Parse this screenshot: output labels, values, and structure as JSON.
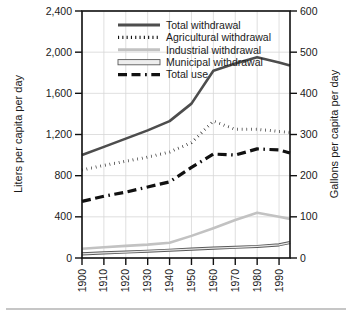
{
  "chart_data": {
    "type": "line",
    "title": "",
    "xlabel": "",
    "ylabel": "Liters per capita per day",
    "y2label": "Gallons per capita per day",
    "xlim": [
      1900,
      1995
    ],
    "ylim": [
      0,
      2400
    ],
    "y2lim": [
      0,
      600
    ],
    "grid": true,
    "legend_position": "top-center-inside",
    "x_tick_labels": [
      "1900",
      "1910",
      "1920",
      "1930",
      "1940",
      "1950",
      "1960",
      "1970",
      "1980",
      "1990"
    ],
    "x_tick_values": [
      1900,
      1910,
      1920,
      1930,
      1940,
      1950,
      1960,
      1970,
      1980,
      1990
    ],
    "y_tick_labels": [
      "0",
      "400",
      "800",
      "1,200",
      "1,600",
      "2,000",
      "2,400"
    ],
    "y_tick_values": [
      0,
      400,
      800,
      1200,
      1600,
      2000,
      2400
    ],
    "y2_tick_labels": [
      "0",
      "100",
      "200",
      "300",
      "400",
      "500",
      "600"
    ],
    "y2_tick_values": [
      0,
      100,
      200,
      300,
      400,
      500,
      600
    ],
    "x": [
      1900,
      1910,
      1920,
      1930,
      1940,
      1950,
      1960,
      1970,
      1980,
      1990,
      1995
    ],
    "series": [
      {
        "name": "Total withdrawal",
        "style": "solid",
        "color": "#4d4d4d",
        "width": 2.6,
        "values": [
          1000,
          1080,
          1160,
          1240,
          1330,
          1500,
          1820,
          1890,
          1950,
          1900,
          1870
        ]
      },
      {
        "name": "Agricultural withdrawal",
        "style": "dotted",
        "color": "#111111",
        "width": 3.0,
        "values": [
          855,
          900,
          940,
          980,
          1030,
          1120,
          1330,
          1250,
          1250,
          1230,
          1220
        ]
      },
      {
        "name": "Industrial withdrawal",
        "style": "solid",
        "color": "#c2c2c2",
        "width": 2.6,
        "values": [
          90,
          105,
          118,
          130,
          148,
          215,
          290,
          370,
          440,
          400,
          380
        ]
      },
      {
        "name": "Municipal withdrawal",
        "style": "solid-outlined",
        "color": "#7d7d7d",
        "width": 2.0,
        "values": [
          40,
          50,
          58,
          66,
          76,
          86,
          96,
          104,
          112,
          128,
          150
        ]
      },
      {
        "name": "Total use",
        "style": "dashed",
        "color": "#111111",
        "width": 3.2,
        "values": [
          550,
          600,
          640,
          690,
          740,
          880,
          1010,
          1000,
          1060,
          1050,
          1020
        ]
      }
    ]
  },
  "legend": {
    "items": [
      {
        "label": "Total withdrawal",
        "swatch": "solid-dark"
      },
      {
        "label": "Agricultural withdrawal",
        "swatch": "dotted-black"
      },
      {
        "label": "Industrial withdrawal",
        "swatch": "solid-lightgray"
      },
      {
        "label": "Municipal withdrawal",
        "swatch": "outlined-bar"
      },
      {
        "label": "Total use",
        "swatch": "dashed-black"
      }
    ]
  },
  "axes": {
    "left_title": "Liters per capita per day",
    "right_title": "Gallons per capita per day"
  }
}
